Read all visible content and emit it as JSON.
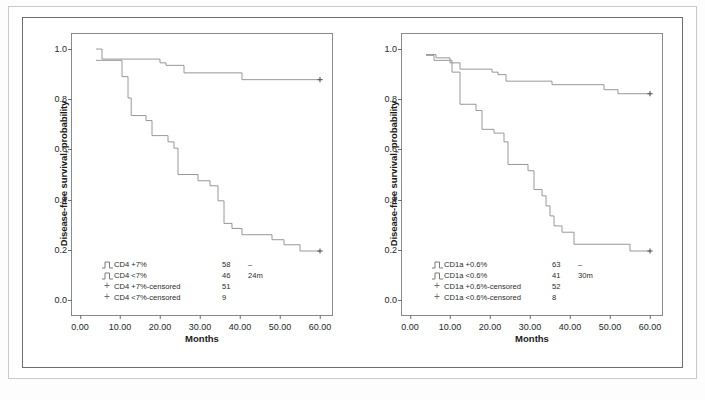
{
  "figure": {
    "panels": [
      {
        "id": "panel-cd4",
        "ylabel": "Disease-free survival, probability",
        "xlabel": "Months",
        "xticks": [
          "0.00",
          "10.00",
          "20.00",
          "30.00",
          "40.00",
          "50.00",
          "60.00"
        ],
        "yticks": [
          "1.0",
          "0.8",
          "0.6",
          "0.4",
          "0.2",
          "0.0"
        ],
        "legend": [
          {
            "marker": "step-icon",
            "label": "CD4 +7%",
            "n": "58",
            "median": "–"
          },
          {
            "marker": "step-icon",
            "label": "CD4 <7%",
            "n": "46",
            "median": "24m"
          },
          {
            "marker": "plus-icon",
            "label": "CD4 +7%-censored",
            "n": "51",
            "median": ""
          },
          {
            "marker": "plus-icon",
            "label": "CD4 <7%-censored",
            "n": "9",
            "median": ""
          }
        ]
      },
      {
        "id": "panel-cd1a",
        "ylabel": "Disease-free survival, probability",
        "xlabel": "Months",
        "xticks": [
          "0.00",
          "10.00",
          "20.00",
          "30.00",
          "40.00",
          "50.00",
          "60.00"
        ],
        "yticks": [
          "1.0",
          "0.8",
          "0.6",
          "0.4",
          "0.2",
          "0.0"
        ],
        "legend": [
          {
            "marker": "step-icon",
            "label": "CD1a +0.6%",
            "n": "63",
            "median": "–"
          },
          {
            "marker": "step-icon",
            "label": "CD1a <0.6%",
            "n": "41",
            "median": "30m"
          },
          {
            "marker": "plus-icon",
            "label": "CD1a +0.6%-censored",
            "n": "52",
            "median": ""
          },
          {
            "marker": "plus-icon",
            "label": "CD1a <0.6%-censored",
            "n": "8",
            "median": ""
          }
        ]
      }
    ]
  },
  "style": {
    "curve_color": "#8c8c8c",
    "frame_color": "#8a8a8a",
    "text_color": "#262626"
  },
  "chart_data": [
    {
      "type": "line",
      "title": "Kaplan-Meier disease-free survival by CD4 expression",
      "xlabel": "Months",
      "ylabel": "Disease-free survival, probability",
      "xlim": [
        -2,
        63
      ],
      "ylim": [
        -0.06,
        1.06
      ],
      "grid": false,
      "legend_position": "lower-left",
      "series": [
        {
          "name": "CD4 +7%",
          "n": 58,
          "median_survival_months": null,
          "steps": [
            [
              4.0,
              1.0
            ],
            [
              5.5,
              1.0
            ],
            [
              5.5,
              0.96
            ],
            [
              20.0,
              0.96
            ],
            [
              20.0,
              0.945
            ],
            [
              21.5,
              0.945
            ],
            [
              21.5,
              0.935
            ],
            [
              26.0,
              0.935
            ],
            [
              26.0,
              0.905
            ],
            [
              40.5,
              0.905
            ],
            [
              40.5,
              0.878
            ],
            [
              60.0,
              0.878
            ]
          ],
          "censored_points": [
            [
              60.0,
              0.878
            ]
          ]
        },
        {
          "name": "CD4 <7%",
          "n": 46,
          "median_survival_months": 24,
          "steps": [
            [
              4.0,
              0.955
            ],
            [
              10.5,
              0.955
            ],
            [
              10.5,
              0.89
            ],
            [
              12.0,
              0.89
            ],
            [
              12.0,
              0.805
            ],
            [
              12.8,
              0.805
            ],
            [
              12.8,
              0.735
            ],
            [
              16.5,
              0.735
            ],
            [
              16.5,
              0.715
            ],
            [
              18.0,
              0.715
            ],
            [
              18.0,
              0.655
            ],
            [
              22.0,
              0.655
            ],
            [
              22.0,
              0.63
            ],
            [
              23.5,
              0.63
            ],
            [
              23.5,
              0.605
            ],
            [
              24.5,
              0.605
            ],
            [
              24.5,
              0.5
            ],
            [
              29.5,
              0.5
            ],
            [
              29.5,
              0.475
            ],
            [
              32.5,
              0.475
            ],
            [
              32.5,
              0.455
            ],
            [
              34.5,
              0.455
            ],
            [
              34.5,
              0.395
            ],
            [
              36.0,
              0.395
            ],
            [
              36.0,
              0.305
            ],
            [
              38.0,
              0.305
            ],
            [
              38.0,
              0.285
            ],
            [
              40.5,
              0.285
            ],
            [
              40.5,
              0.26
            ],
            [
              48.0,
              0.26
            ],
            [
              48.0,
              0.24
            ],
            [
              51.0,
              0.24
            ],
            [
              51.0,
              0.22
            ],
            [
              55.0,
              0.22
            ],
            [
              55.0,
              0.195
            ],
            [
              60.0,
              0.195
            ]
          ],
          "censored_points": [
            [
              60.0,
              0.195
            ]
          ]
        }
      ]
    },
    {
      "type": "line",
      "title": "Kaplan-Meier disease-free survival by CD1a expression",
      "xlabel": "Months",
      "ylabel": "Disease-free survival, probability",
      "xlim": [
        -2,
        63
      ],
      "ylim": [
        -0.06,
        1.06
      ],
      "grid": false,
      "legend_position": "lower-left",
      "series": [
        {
          "name": "CD1a +0.6%",
          "n": 63,
          "median_survival_months": null,
          "steps": [
            [
              4.0,
              0.978
            ],
            [
              6.5,
              0.978
            ],
            [
              6.5,
              0.965
            ],
            [
              10.0,
              0.965
            ],
            [
              10.0,
              0.945
            ],
            [
              12.5,
              0.945
            ],
            [
              12.5,
              0.92
            ],
            [
              20.5,
              0.92
            ],
            [
              20.5,
              0.908
            ],
            [
              22.0,
              0.908
            ],
            [
              22.0,
              0.898
            ],
            [
              24.0,
              0.898
            ],
            [
              24.0,
              0.872
            ],
            [
              35.5,
              0.872
            ],
            [
              35.5,
              0.858
            ],
            [
              48.5,
              0.858
            ],
            [
              48.5,
              0.838
            ],
            [
              52.0,
              0.838
            ],
            [
              52.0,
              0.822
            ],
            [
              60.0,
              0.822
            ]
          ],
          "censored_points": [
            [
              60.0,
              0.822
            ]
          ]
        },
        {
          "name": "CD1a <0.6%",
          "n": 41,
          "median_survival_months": 30,
          "steps": [
            [
              4.0,
              0.975
            ],
            [
              6.0,
              0.975
            ],
            [
              6.0,
              0.955
            ],
            [
              10.5,
              0.955
            ],
            [
              10.5,
              0.908
            ],
            [
              12.5,
              0.908
            ],
            [
              12.5,
              0.78
            ],
            [
              16.5,
              0.78
            ],
            [
              16.5,
              0.755
            ],
            [
              18.0,
              0.755
            ],
            [
              18.0,
              0.68
            ],
            [
              21.0,
              0.68
            ],
            [
              21.0,
              0.665
            ],
            [
              23.5,
              0.665
            ],
            [
              23.5,
              0.63
            ],
            [
              24.5,
              0.63
            ],
            [
              24.5,
              0.54
            ],
            [
              29.5,
              0.54
            ],
            [
              29.5,
              0.515
            ],
            [
              31.0,
              0.515
            ],
            [
              31.0,
              0.44
            ],
            [
              33.0,
              0.44
            ],
            [
              33.0,
              0.415
            ],
            [
              34.0,
              0.415
            ],
            [
              34.0,
              0.375
            ],
            [
              35.0,
              0.375
            ],
            [
              35.0,
              0.335
            ],
            [
              36.0,
              0.335
            ],
            [
              36.0,
              0.295
            ],
            [
              38.0,
              0.295
            ],
            [
              38.0,
              0.27
            ],
            [
              41.0,
              0.27
            ],
            [
              41.0,
              0.222
            ],
            [
              55.0,
              0.222
            ],
            [
              55.0,
              0.195
            ],
            [
              60.0,
              0.195
            ]
          ],
          "censored_points": [
            [
              60.0,
              0.195
            ]
          ]
        }
      ]
    }
  ]
}
